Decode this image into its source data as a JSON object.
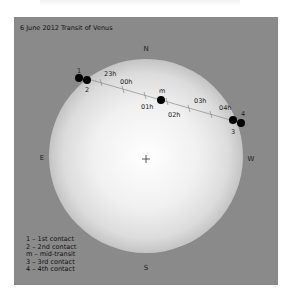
{
  "title": "6 June 2012 Transit of Venus",
  "compass": {
    "north": "N",
    "south": "S",
    "east": "E",
    "west": "W"
  },
  "colors": {
    "panel": "#8a8a8a",
    "sun_center": "#ffffff",
    "sun_edge": "#c4c4c4",
    "venus": "#000000",
    "path": "#777777"
  },
  "contacts": [
    {
      "label": "1",
      "x": 65,
      "y": 61
    },
    {
      "label": "2",
      "x": 73,
      "y": 63
    },
    {
      "label": "m",
      "x": 147,
      "y": 83
    },
    {
      "label": "3",
      "x": 219,
      "y": 103
    },
    {
      "label": "4",
      "x": 227,
      "y": 106
    }
  ],
  "hours": [
    {
      "label": "23h",
      "x": 90,
      "y": 57
    },
    {
      "label": "00h",
      "x": 111,
      "y": 65
    },
    {
      "label": "01h",
      "x": 133,
      "y": 89
    },
    {
      "label": "02h",
      "x": 161,
      "y": 97
    },
    {
      "label": "03h",
      "x": 186,
      "y": 84
    },
    {
      "label": "04h",
      "x": 212,
      "y": 91
    }
  ],
  "legend": [
    "1 – 1st contact",
    "2 – 2nd contact",
    "m – mid-transit",
    "3 – 3rd contact",
    "4 – 4th contact"
  ]
}
